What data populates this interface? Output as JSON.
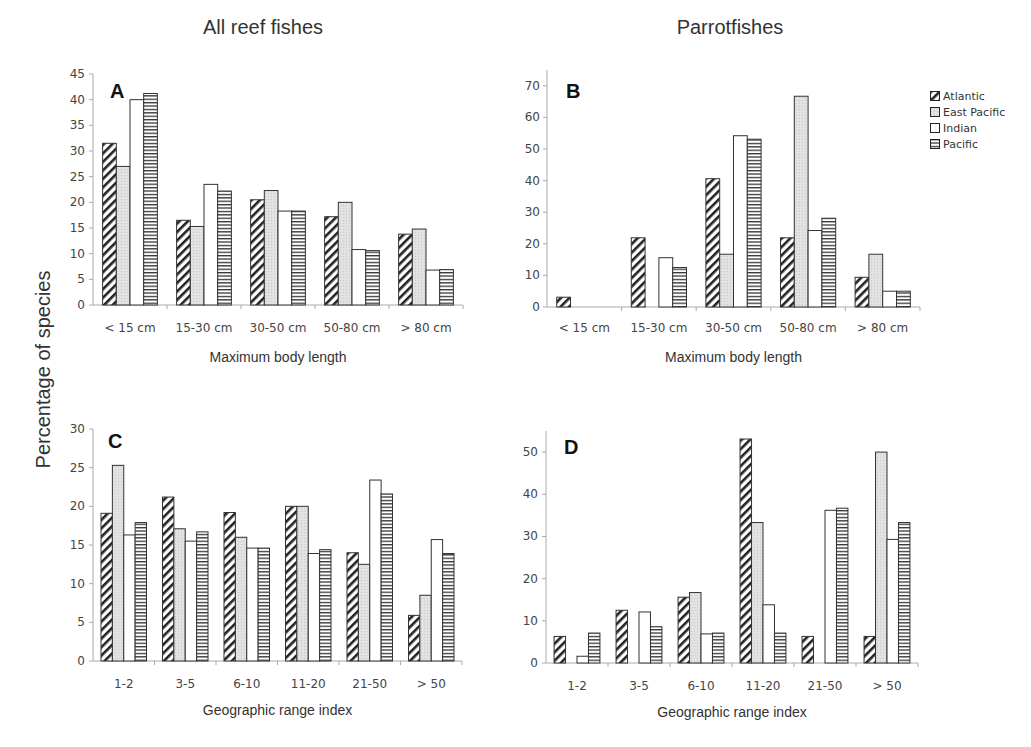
{
  "titles": {
    "left": "All reef fishes",
    "right": "Parrotfishes"
  },
  "ylabel": "Percentage of species",
  "legend": [
    {
      "name": "Atlantic",
      "pattern": "diagonal"
    },
    {
      "name": "East Pacific",
      "pattern": "dotted-gray"
    },
    {
      "name": "Indian",
      "pattern": "white"
    },
    {
      "name": "Pacific",
      "pattern": "horizontal"
    }
  ],
  "colors": {
    "axis": "#999999",
    "bar_stroke": "#333333",
    "gray_fill": "#e3e3e3",
    "text": "#333333"
  },
  "chart_data": [
    {
      "panel": "A",
      "type": "bar",
      "title": "All reef fishes",
      "xlabel": "Maximum body length",
      "ylabel": "Percentage of species",
      "categories": [
        "< 15 cm",
        "15-30 cm",
        "30-50 cm",
        "50-80 cm",
        "> 80 cm"
      ],
      "ylim": [
        0,
        45
      ],
      "yticks": [
        0,
        5,
        10,
        15,
        20,
        25,
        30,
        35,
        40,
        45
      ],
      "series": [
        {
          "name": "Atlantic",
          "values": [
            31.5,
            16.5,
            20.5,
            17.2,
            13.8
          ]
        },
        {
          "name": "East Pacific",
          "values": [
            27.0,
            15.3,
            22.3,
            20.0,
            14.8
          ]
        },
        {
          "name": "Indian",
          "values": [
            40.0,
            23.5,
            18.3,
            10.8,
            6.8
          ]
        },
        {
          "name": "Pacific",
          "values": [
            41.2,
            22.2,
            18.3,
            10.6,
            6.9
          ]
        }
      ]
    },
    {
      "panel": "B",
      "type": "bar",
      "title": "Parrotfishes",
      "xlabel": "Maximum body length",
      "ylabel": "Percentage of species",
      "categories": [
        "< 15 cm",
        "15-30 cm",
        "30-50 cm",
        "50-80 cm",
        "> 80 cm"
      ],
      "ylim": [
        0,
        75
      ],
      "yticks": [
        0,
        10,
        20,
        30,
        40,
        50,
        60,
        70
      ],
      "series": [
        {
          "name": "Atlantic",
          "values": [
            3.1,
            21.9,
            40.6,
            21.9,
            9.4
          ]
        },
        {
          "name": "East Pacific",
          "values": [
            0,
            0,
            16.7,
            66.7,
            16.7
          ]
        },
        {
          "name": "Indian",
          "values": [
            0,
            15.6,
            54.2,
            24.2,
            5.0
          ]
        },
        {
          "name": "Pacific",
          "values": [
            0,
            12.5,
            53.1,
            28.1,
            5.0
          ]
        }
      ]
    },
    {
      "panel": "C",
      "type": "bar",
      "title": "All reef fishes",
      "xlabel": "Geographic range index",
      "ylabel": "Percentage of species",
      "categories": [
        "1-2",
        "3-5",
        "6-10",
        "11-20",
        "21-50",
        "> 50"
      ],
      "ylim": [
        0,
        30
      ],
      "yticks": [
        0,
        5,
        10,
        15,
        20,
        25,
        30
      ],
      "series": [
        {
          "name": "Atlantic",
          "values": [
            19.1,
            21.2,
            19.2,
            20.0,
            14.0,
            5.9
          ]
        },
        {
          "name": "East Pacific",
          "values": [
            25.3,
            17.1,
            16.0,
            20.0,
            12.5,
            8.5
          ]
        },
        {
          "name": "Indian",
          "values": [
            16.3,
            15.5,
            14.6,
            13.9,
            23.4,
            15.7
          ]
        },
        {
          "name": "Pacific",
          "values": [
            17.9,
            16.7,
            14.6,
            14.4,
            21.6,
            13.9
          ]
        }
      ]
    },
    {
      "panel": "D",
      "type": "bar",
      "title": "Parrotfishes",
      "xlabel": "Geographic range index",
      "ylabel": "Percentage of species",
      "categories": [
        "1-2",
        "3-5",
        "6-10",
        "11-20",
        "21-50",
        "> 50"
      ],
      "ylim": [
        0,
        55
      ],
      "yticks": [
        0,
        10,
        20,
        30,
        40,
        50
      ],
      "series": [
        {
          "name": "Atlantic",
          "values": [
            6.3,
            12.5,
            15.6,
            53.1,
            6.3,
            6.3
          ]
        },
        {
          "name": "East Pacific",
          "values": [
            0,
            0,
            16.7,
            33.3,
            0,
            50.0
          ]
        },
        {
          "name": "Indian",
          "values": [
            1.6,
            12.1,
            6.9,
            13.8,
            36.2,
            29.3
          ]
        },
        {
          "name": "Pacific",
          "values": [
            7.1,
            8.6,
            7.1,
            7.1,
            36.7,
            33.3
          ]
        }
      ]
    }
  ]
}
